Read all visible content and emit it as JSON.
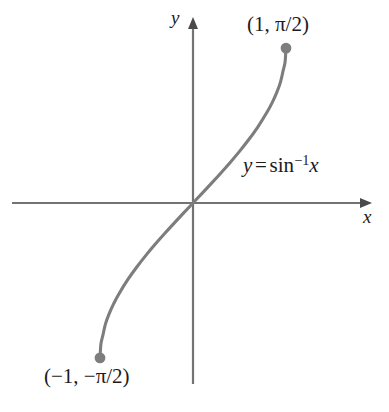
{
  "figure": {
    "background_color": "#ffffff",
    "curve_color": "#7d7d7d",
    "axis_color": "#737373",
    "text_color": "#1b1b1b"
  },
  "labels": {
    "axis_x": "x",
    "axis_y": "y",
    "equation_lhs": "y",
    "equation_equals": "=",
    "equation_fn": "sin",
    "equation_exponent": "−1",
    "equation_arg": "x",
    "point_upper": "(1, π/2)",
    "point_lower": "(−1, −π/2)"
  },
  "chart_data": {
    "type": "line",
    "title": "",
    "xlabel": "x",
    "ylabel": "y",
    "grid": false,
    "legend": null,
    "annotations": [
      {
        "text": "y = sin−1 x",
        "x": 0.52,
        "y": 0.33
      },
      {
        "text": "(1, π/2)",
        "x": 0.6,
        "y": 1.72
      },
      {
        "text": "(−1, −π/2)",
        "x": -1.05,
        "y": -1.82
      }
    ],
    "xlim": [
      -1.9,
      1.9
    ],
    "ylim": [
      -1.9,
      1.9
    ],
    "endpoints": [
      {
        "label": "(−1, −π/2)",
        "x": -1,
        "y": -1.5708,
        "marker": "filled-circle"
      },
      {
        "label": "(1, π/2)",
        "x": 1,
        "y": 1.5708,
        "marker": "filled-circle"
      }
    ],
    "series": [
      {
        "name": "y = sin^-1 x",
        "x": [
          -1,
          -0.99,
          -0.97,
          -0.94,
          -0.9,
          -0.85,
          -0.8,
          -0.7,
          -0.6,
          -0.5,
          -0.4,
          -0.3,
          -0.2,
          -0.1,
          0,
          0.1,
          0.2,
          0.3,
          0.4,
          0.5,
          0.6,
          0.7,
          0.8,
          0.85,
          0.9,
          0.94,
          0.97,
          0.99,
          1
        ],
        "y": [
          -1.5708,
          -1.4289,
          -1.3453,
          -1.2239,
          -1.1198,
          -1.016,
          -0.9273,
          -0.7754,
          -0.6435,
          -0.5236,
          -0.4115,
          -0.3047,
          -0.2014,
          -0.1002,
          0,
          0.1002,
          0.2014,
          0.3047,
          0.4115,
          0.5236,
          0.6435,
          0.7754,
          0.9273,
          1.016,
          1.1198,
          1.2239,
          1.3453,
          1.4289,
          1.5708
        ]
      }
    ]
  }
}
